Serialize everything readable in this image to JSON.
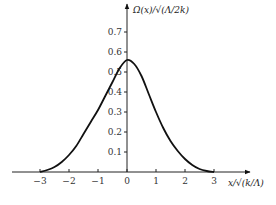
{
  "chart_data": {
    "type": "line",
    "title": "",
    "xlabel": "x/√(k/Λ)",
    "ylabel": "Ω(x)/√(Λ/2k)",
    "xlim": [
      -3.5,
      3.8
    ],
    "ylim": [
      0,
      0.75
    ],
    "x_ticks": [
      -3,
      -2,
      -1,
      0,
      1,
      2,
      3
    ],
    "x_tick_labels": [
      "−3",
      "−2",
      "−1",
      "0",
      "1",
      "2",
      "3"
    ],
    "y_ticks": [
      0.1,
      0.2,
      0.3,
      0.4,
      0.5,
      0.6,
      0.7
    ],
    "y_tick_labels": [
      "0.1",
      "0.2",
      "0.3",
      "0.4",
      "0.5",
      "0.6",
      "0.7"
    ],
    "grid": false,
    "series": [
      {
        "name": "Ω(x)",
        "x": [
          -3,
          -2.75,
          -2.5,
          -2.25,
          -2,
          -1.75,
          -1.5,
          -1.25,
          -1,
          -0.75,
          -0.5,
          -0.25,
          0,
          0.25,
          0.5,
          0.75,
          1,
          1.25,
          1.5,
          1.75,
          2,
          2.25,
          2.5,
          2.75,
          3
        ],
        "y": [
          0.0,
          0.01,
          0.025,
          0.05,
          0.085,
          0.13,
          0.19,
          0.25,
          0.31,
          0.38,
          0.45,
          0.52,
          0.56,
          0.54,
          0.48,
          0.39,
          0.3,
          0.22,
          0.155,
          0.105,
          0.065,
          0.035,
          0.015,
          0.005,
          0.0
        ],
        "color": "#111111"
      }
    ]
  }
}
